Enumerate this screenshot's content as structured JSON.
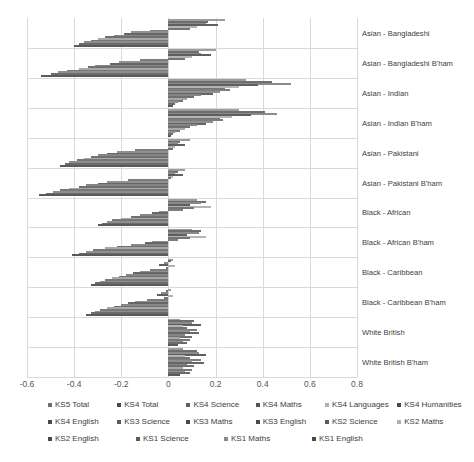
{
  "chart_data": {
    "type": "bar",
    "orientation": "horizontal",
    "title": "",
    "xlabel": "",
    "ylabel": "",
    "xlim": [
      -0.6,
      0.8
    ],
    "xticks": [
      "-0.6",
      "-0.4",
      "-0.2",
      "0",
      "0.2",
      "0.4",
      "0.6",
      "0.8"
    ],
    "xtick_values": [
      -0.6,
      -0.4,
      -0.2,
      0,
      0.2,
      0.4,
      0.6,
      0.8
    ],
    "grid": true,
    "legend_position": "bottom",
    "categories": [
      "Asian - Bangladeshi",
      "Asian - Bangladeshi B'ham",
      "Asian - Indian",
      "Asian - Indian B'ham",
      "Asian - Pakistani",
      "Asian - Pakistani B'ham",
      "Black - African",
      "Black - African B'ham",
      "Black - Caribbean",
      "Black - Caribbean B'ham",
      "White British",
      "White British B'ham"
    ],
    "series": [
      {
        "name": "KS5 Total",
        "color": "#9c9c9c",
        "values": [
          0.24,
          0.2,
          0.33,
          0.3,
          0.09,
          0.07,
          0.12,
          0.1,
          0.02,
          0.01,
          0.05,
          0.06
        ]
      },
      {
        "name": "KS4 Total",
        "color": "#6e6e6e",
        "values": [
          0.17,
          0.13,
          0.44,
          0.41,
          0.05,
          0.04,
          0.16,
          0.14,
          0.01,
          -0.01,
          0.11,
          0.12
        ]
      },
      {
        "name": "KS4 Science",
        "color": "#8a8a8a",
        "values": [
          0.16,
          0.14,
          0.52,
          0.46,
          0.04,
          0.03,
          0.14,
          0.13,
          -0.02,
          -0.03,
          0.1,
          0.13
        ]
      },
      {
        "name": "KS4 Maths",
        "color": "#5f5f5f",
        "values": [
          0.21,
          0.18,
          0.38,
          0.35,
          0.07,
          0.06,
          0.09,
          0.08,
          -0.04,
          -0.05,
          0.14,
          0.16
        ]
      },
      {
        "name": "KS4 Languages",
        "color": "#b4b4b4",
        "values": [
          0.12,
          0.1,
          0.3,
          0.27,
          0.03,
          0.02,
          0.18,
          0.16,
          0.03,
          0.02,
          0.06,
          0.07
        ]
      },
      {
        "name": "KS4 Humanities",
        "color": "#747474",
        "values": [
          0.09,
          0.07,
          0.24,
          0.22,
          0.02,
          0.01,
          0.11,
          0.09,
          -0.01,
          -0.02,
          0.08,
          0.09
        ]
      },
      {
        "name": "KS4 English",
        "color": "#7d7d7d",
        "values": [
          -0.08,
          -0.12,
          0.26,
          0.23,
          -0.14,
          -0.17,
          0.06,
          0.04,
          -0.08,
          -0.09,
          0.12,
          0.14
        ]
      },
      {
        "name": "KS3 Science",
        "color": "#909090",
        "values": [
          -0.16,
          -0.21,
          0.22,
          0.19,
          -0.22,
          -0.26,
          -0.04,
          -0.07,
          -0.12,
          -0.14,
          0.09,
          0.1
        ]
      },
      {
        "name": "KS3 Maths",
        "color": "#666666",
        "values": [
          -0.19,
          -0.25,
          0.19,
          0.16,
          -0.26,
          -0.3,
          -0.07,
          -0.1,
          -0.15,
          -0.17,
          0.13,
          0.15
        ]
      },
      {
        "name": "KS3 English",
        "color": "#858585",
        "values": [
          -0.23,
          -0.31,
          0.14,
          0.12,
          -0.3,
          -0.35,
          -0.12,
          -0.16,
          -0.18,
          -0.2,
          0.07,
          0.08
        ]
      },
      {
        "name": "KS2 Science",
        "color": "#707070",
        "values": [
          -0.27,
          -0.34,
          0.11,
          0.09,
          -0.33,
          -0.38,
          -0.16,
          -0.22,
          -0.21,
          -0.23,
          0.1,
          0.11
        ]
      },
      {
        "name": "KS2 Maths",
        "color": "#a8a8a8",
        "values": [
          -0.3,
          -0.38,
          0.08,
          0.07,
          -0.36,
          -0.42,
          -0.2,
          -0.27,
          -0.24,
          -0.26,
          0.05,
          0.06
        ]
      },
      {
        "name": "KS2 English",
        "color": "#787878",
        "values": [
          -0.33,
          -0.43,
          0.06,
          0.05,
          -0.39,
          -0.46,
          -0.24,
          -0.32,
          -0.27,
          -0.29,
          0.09,
          0.1
        ]
      },
      {
        "name": "KS1 Science",
        "color": "#8e8e8e",
        "values": [
          -0.36,
          -0.47,
          0.04,
          0.03,
          -0.42,
          -0.49,
          -0.26,
          -0.35,
          -0.29,
          -0.31,
          0.06,
          0.07
        ]
      },
      {
        "name": "KS1 Maths",
        "color": "#6b6b6b",
        "values": [
          -0.38,
          -0.5,
          0.03,
          0.02,
          -0.44,
          -0.52,
          -0.28,
          -0.38,
          -0.31,
          -0.33,
          0.08,
          0.09
        ]
      },
      {
        "name": "KS1 English",
        "color": "#5a5a5a",
        "values": [
          -0.4,
          -0.54,
          0.02,
          0.01,
          -0.46,
          -0.55,
          -0.3,
          -0.41,
          -0.33,
          -0.35,
          0.04,
          0.05
        ]
      }
    ],
    "legend": [
      {
        "label": "KS5 Total",
        "color": "#6e6e6e"
      },
      {
        "label": "KS4 Total",
        "color": "#4a4a4a"
      },
      {
        "label": "KS4 Science",
        "color": "#5f5f5f"
      },
      {
        "label": "KS4 Maths",
        "color": "#555555"
      },
      {
        "label": "KS4 Languages",
        "color": "#b0b0b0"
      },
      {
        "label": "KS4 Humanities",
        "color": "#4a4a4a"
      },
      {
        "label": "KS4 English",
        "color": "#4a4a4a"
      },
      {
        "label": "KS3 Science",
        "color": "#5a5a5a"
      },
      {
        "label": "KS3 Maths",
        "color": "#4a4a4a"
      },
      {
        "label": "KS3 English",
        "color": "#4a4a4a"
      },
      {
        "label": "KS2 Science",
        "color": "#5a5a5a"
      },
      {
        "label": "KS2 Maths",
        "color": "#b0b0b0"
      },
      {
        "label": "KS2 English",
        "color": "#4a4a4a"
      },
      {
        "label": "KS1 Science",
        "color": "#5a5a5a"
      },
      {
        "label": "KS1 Maths",
        "color": "#8a8a8a"
      },
      {
        "label": "KS1 English",
        "color": "#4a4a4a"
      }
    ]
  }
}
